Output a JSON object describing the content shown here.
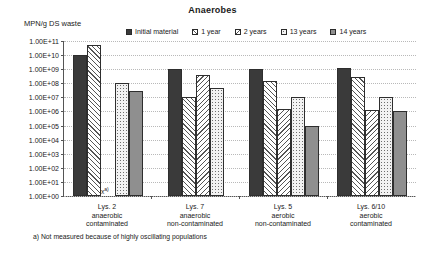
{
  "chart_data": {
    "type": "bar",
    "title": "Anaerobes",
    "ylabel": "MPN/g DS waste",
    "xlabel": "",
    "scale": "log",
    "ylim": [
      1,
      100000000000.0
    ],
    "grid": true,
    "legend_position": "top",
    "ytick_labels": [
      "1.00E+11",
      "1.00E+10",
      "1.00E+09",
      "1.00E+08",
      "1.00E+07",
      "1.00E+06",
      "1.00E+05",
      "1.00E+04",
      "1.00E+03",
      "1.00E+02",
      "1.00E+01",
      "1.00E+00"
    ],
    "ytick_values": [
      100000000000.0,
      10000000000.0,
      1000000000.0,
      100000000.0,
      10000000.0,
      1000000.0,
      100000.0,
      10000.0,
      1000.0,
      100.0,
      10.0,
      1.0
    ],
    "categories": [
      "Lys. 2\nanaerobic\ncontaminated",
      "Lys. 7\nanaerobic\nnon-contaminated",
      "Lys. 5\naerobic\nnon-contaminated",
      "Lys. 6/10\naerobic\ncontaminated"
    ],
    "category_lines": [
      [
        "Lys. 2",
        "anaerobic",
        "contaminated"
      ],
      [
        "Lys. 7",
        "anaerobic",
        "non-contaminated"
      ],
      [
        "Lys. 5",
        "aerobic",
        "non-contaminated"
      ],
      [
        "Lys. 6/10",
        "aerobic",
        "contaminated"
      ]
    ],
    "series": [
      {
        "name": "Initial material",
        "pattern": "solid-dark",
        "values": [
          10000000000.0,
          1000000000.0,
          1000000000.0,
          1300000000.0
        ]
      },
      {
        "name": "1 year",
        "pattern": "diagonal-hatch",
        "values": [
          50000000000.0,
          10000000.0,
          150000000.0,
          300000000.0
        ]
      },
      {
        "name": "2 years",
        "pattern": "chevron-hatch",
        "values": [
          null,
          400000000.0,
          1500000.0,
          1200000.0
        ]
      },
      {
        "name": "13 years",
        "pattern": "dots",
        "values": [
          100000000.0,
          50000000.0,
          10000000.0,
          10000000.0
        ]
      },
      {
        "name": "14 years",
        "pattern": "solid-gray",
        "values": [
          30000000.0,
          null,
          100000.0,
          1000000.0
        ]
      }
    ],
    "annotations": [
      {
        "text": "x",
        "superscript": "a)",
        "group": "Lys. 2",
        "series": "2 years"
      }
    ],
    "footnote": "a) Not measured because of highly oscillating populations",
    "colors": {
      "solid_dark": "#3a3a3a",
      "solid_gray": "#8f8f8f",
      "hatch_line": "#555555",
      "dots_fill": "#f2f2f2",
      "axis": "#555555",
      "grid": "#b9b9b9"
    }
  }
}
